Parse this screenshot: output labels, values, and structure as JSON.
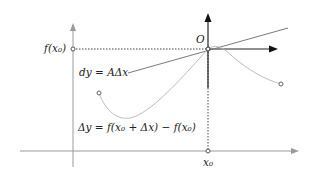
{
  "diagram": {
    "labels": {
      "f_x0": "f(x₀)",
      "origin": "O",
      "dy": "dy = AΔx",
      "delta_y": "Δy = f(x₀ + Δx) − f(x₀)",
      "x0": "x₀"
    },
    "colors": {
      "axis_main": "#9a9a9a",
      "axis_local": "#222222",
      "tangent": "#7a7a7a",
      "curve": "#bdbdbd",
      "dotted": "#444444",
      "point": "#555555"
    },
    "geometry": {
      "main_axis_x": 73,
      "main_axis_y": 151,
      "origin": [
        208,
        49
      ],
      "curve_start": [
        99,
        93
      ],
      "curve_end": [
        281,
        84
      ]
    }
  }
}
